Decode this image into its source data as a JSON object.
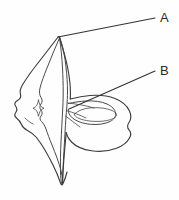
{
  "figure": {
    "background_color": "#fefefe",
    "line_color": "#3c3c3c",
    "label_color": "#2b2b2b",
    "width": 179,
    "height": 200
  },
  "callouts": [
    {
      "id": "callout-a",
      "label": "A",
      "label_x": 160,
      "label_y": 18,
      "leader_start_x": 58,
      "leader_start_y": 37,
      "leader_end_x": 155,
      "leader_end_y": 18
    },
    {
      "id": "callout-b",
      "label": "B",
      "label_x": 160,
      "label_y": 71,
      "leader_start_x": 69,
      "leader_start_y": 109,
      "leader_end_x": 155,
      "leader_end_y": 71
    }
  ],
  "shapes": {
    "body_outline_name": "specimen-body-outline",
    "central_ridge_name": "central-ridge",
    "left_wing_name": "left-wing-lobe",
    "right_loop_name": "right-loop-ring",
    "inner_oval_name": "inner-lens-oval",
    "small_star_name": "small-diamond-star"
  }
}
